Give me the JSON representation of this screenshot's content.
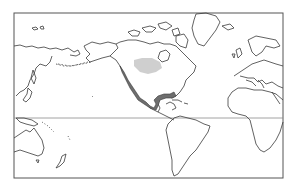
{
  "map": {
    "projection": "equirectangular-pacific-centered",
    "center_region": "Americas",
    "frame": {
      "x": 14,
      "y": 13,
      "width": 269,
      "height": 165
    },
    "equator_y": 118,
    "colors": {
      "background": "#ffffff",
      "coastline": "#3a3a3a",
      "frame": "#555555",
      "equator": "#8a8a8a",
      "range_dark": "#6e6e6e",
      "range_light": "#cfcfcf",
      "route": "#444444"
    },
    "highlighted_regions": [
      {
        "name": "light-shaded-region",
        "shade": "light"
      },
      {
        "name": "dark-shaded-coastal-range",
        "shade": "dark"
      }
    ]
  }
}
